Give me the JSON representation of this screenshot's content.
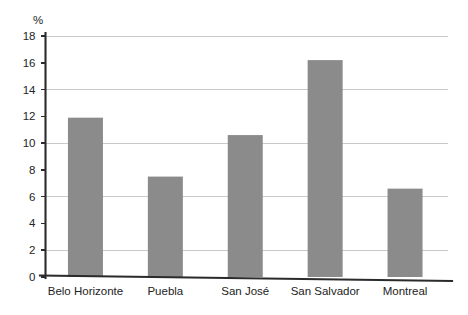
{
  "chart_data": {
    "type": "bar",
    "title": "",
    "subtitle": "",
    "xlabel": "",
    "ylabel": "%",
    "unit_label": "%",
    "categories": [
      "Belo Horizonte",
      "Puebla",
      "San José",
      "San Salvador",
      "Montreal"
    ],
    "values": [
      11.9,
      7.5,
      10.6,
      16.2,
      6.6
    ],
    "series": [
      {
        "name": "",
        "values": [
          11.9,
          7.5,
          10.6,
          16.2,
          6.6
        ]
      }
    ],
    "ylim": [
      0,
      18
    ],
    "xlim": [
      0,
      5
    ],
    "ytick_labels": [
      "0",
      "2",
      "4",
      "6",
      "8",
      "10",
      "12",
      "14",
      "16",
      "18"
    ],
    "ytick_values": [
      0,
      2,
      4,
      6,
      8,
      10,
      12,
      14,
      16,
      18
    ],
    "ytick_interval": 2,
    "gridline_values": [
      2,
      6,
      10,
      14,
      18
    ],
    "grid": true,
    "grid_axis": "y",
    "legend": false,
    "legend_position": "none",
    "annotations": [],
    "colors": {
      "bar_fill": "#8b8b8b",
      "gridline": "#c9c9c9",
      "axis": "#2b2b2b",
      "text": "#222222",
      "background": "#ffffff"
    }
  }
}
